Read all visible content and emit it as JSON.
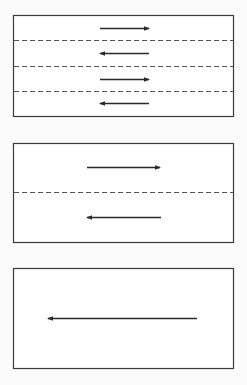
{
  "colors": {
    "background": "#fbfbfb",
    "box_fill": "#ffffff",
    "stroke": "#3a3a3a",
    "dash": "#555555"
  },
  "diagram": {
    "panels": [
      {
        "name": "four-lane-panel",
        "box": {
          "x": 13,
          "y": 15,
          "w": 220,
          "h": 101
        },
        "dividers_y": [
          40,
          66,
          91
        ],
        "arrows": [
          {
            "direction": "right",
            "x1": 100,
            "x2": 149,
            "y": 28
          },
          {
            "direction": "left",
            "x1": 100,
            "x2": 149,
            "y": 53
          },
          {
            "direction": "right",
            "x1": 100,
            "x2": 149,
            "y": 79
          },
          {
            "direction": "left",
            "x1": 100,
            "x2": 149,
            "y": 103
          }
        ]
      },
      {
        "name": "two-lane-panel",
        "box": {
          "x": 13,
          "y": 143,
          "w": 220,
          "h": 99
        },
        "dividers_y": [
          192
        ],
        "arrows": [
          {
            "direction": "right",
            "x1": 87,
            "x2": 160,
            "y": 167
          },
          {
            "direction": "left",
            "x1": 87,
            "x2": 161,
            "y": 217
          }
        ]
      },
      {
        "name": "one-lane-panel",
        "box": {
          "x": 13,
          "y": 268,
          "w": 220,
          "h": 100
        },
        "dividers_y": [],
        "arrows": [
          {
            "direction": "left",
            "x1": 48,
            "x2": 197,
            "y": 318
          }
        ]
      }
    ]
  }
}
